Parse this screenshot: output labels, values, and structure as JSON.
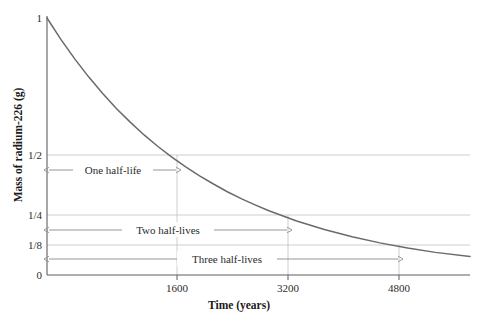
{
  "figure": {
    "name": "radioactive-decay-half-life-graph",
    "background": "#ffffff",
    "curve_color": "#6a6a6a",
    "grid_color": "#c2c2c2",
    "axis_color": "#5f5f5f",
    "annotation_color": "#8a8a8a"
  },
  "axes": {
    "x_title": "Time (years)",
    "y_title": "Mass of radium-226 (g)"
  },
  "chart_data": {
    "type": "line",
    "title": "",
    "xlabel": "Time (years)",
    "ylabel": "Mass of radium-226 (g)",
    "xlim": [
      0,
      6100
    ],
    "ylim": [
      0,
      1
    ],
    "grid": true,
    "legend": "none",
    "x_ticks": [
      1600,
      3200,
      4800
    ],
    "x_tick_labels": [
      "1600",
      "3200",
      "4800"
    ],
    "y_ticks": [
      0,
      0.125,
      0.25,
      0.5,
      1
    ],
    "y_tick_labels": [
      "0",
      "1/8",
      "1/4",
      "1/2",
      "1"
    ],
    "half_life_years": 1600,
    "initial_mass_g": 1,
    "series": [
      {
        "name": "Mass of radium-226",
        "x": [
          0,
          200,
          400,
          600,
          800,
          1000,
          1200,
          1400,
          1600,
          1800,
          2000,
          2200,
          2400,
          2600,
          2800,
          3000,
          3200,
          3600,
          4000,
          4400,
          4800,
          5200,
          5600,
          6100
        ],
        "y": [
          1.0,
          0.917,
          0.841,
          0.771,
          0.707,
          0.648,
          0.595,
          0.545,
          0.5,
          0.459,
          0.421,
          0.386,
          0.354,
          0.324,
          0.297,
          0.273,
          0.25,
          0.21,
          0.177,
          0.149,
          0.125,
          0.105,
          0.088,
          0.072
        ]
      }
    ],
    "annotations": [
      {
        "label": "One half-life",
        "x_start": 0,
        "x_end": 1600,
        "y_value": 0.5,
        "marker_point": [
          1600,
          0.5
        ]
      },
      {
        "label": "Two half-lives",
        "x_start": 0,
        "x_end": 3200,
        "y_value": 0.25,
        "marker_point": [
          3200,
          0.25
        ]
      },
      {
        "label": "Three half-lives",
        "x_start": 0,
        "x_end": 4800,
        "y_value": 0.125,
        "marker_point": [
          4800,
          0.125
        ]
      }
    ]
  },
  "labels": {
    "y_one": "1",
    "y_half": "1/2",
    "y_quarter": "1/4",
    "y_eighth": "1/8",
    "y_zero": "0",
    "x_1600": "1600",
    "x_3200": "3200",
    "x_4800": "4800",
    "annot_one": "One half-life",
    "annot_two": "Two half-lives",
    "annot_three": "Three half-lives"
  }
}
